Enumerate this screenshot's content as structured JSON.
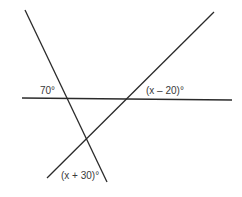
{
  "diagram": {
    "type": "geometry-angles",
    "line_color": "#2a2a2a",
    "lines": [
      {
        "id": "horizontal",
        "x1": 22,
        "y1": 98,
        "x2": 232,
        "y2": 100
      },
      {
        "id": "left-diagonal",
        "x1": 25,
        "y1": 10,
        "x2": 107,
        "y2": 182
      },
      {
        "id": "right-diagonal",
        "x1": 214,
        "y1": 12,
        "x2": 47,
        "y2": 178
      }
    ],
    "angle_labels": {
      "top_left": "70°",
      "top_right": "(x – 20)°",
      "bottom": "(x + 30)°"
    }
  }
}
